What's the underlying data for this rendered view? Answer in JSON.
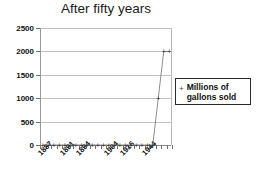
{
  "chart_data": {
    "type": "line",
    "title": "After fifty years",
    "xlabel": "",
    "ylabel": "",
    "ylim": [
      0,
      2500
    ],
    "yticks": [
      0,
      500,
      1000,
      1500,
      2000,
      2500
    ],
    "grid": true,
    "legend_position": "right",
    "legend": [
      "Millions of gallons sold"
    ],
    "marker": "+",
    "categories": [
      "1887",
      "1888",
      "1889",
      "1890",
      "1891",
      "1892",
      "1893",
      "1894",
      "1895",
      "1896",
      "1897",
      "1900",
      "1904",
      "1908",
      "1912",
      "1916",
      "1920",
      "1930",
      "1940",
      "1944",
      "1950",
      "1955",
      "1960",
      "1965"
    ],
    "xtick_labels_shown": [
      "1887",
      "1891",
      "1894",
      "1904",
      "1916",
      "1944"
    ],
    "series": [
      {
        "name": "Millions of gallons sold",
        "values": [
          0,
          0,
          0,
          0,
          0,
          0,
          0,
          0,
          0,
          0,
          0,
          0,
          0,
          0,
          0,
          0,
          0,
          0,
          0,
          0,
          0,
          1000,
          2000,
          2000
        ]
      }
    ],
    "colors": {
      "series_line": "#808080",
      "gridline": "#c2c2c2",
      "axis": "#8d8d8d",
      "text": "#111111",
      "background": "#ffffff"
    }
  }
}
